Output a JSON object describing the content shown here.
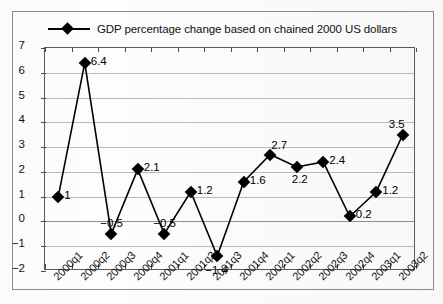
{
  "chart_data": {
    "type": "line",
    "title": "",
    "legend": [
      "GDP percentage change based on chained 2000 US dollars"
    ],
    "legend_position": "top",
    "categories": [
      "2000q1",
      "2000q2",
      "2000q3",
      "2000q4",
      "2001q1",
      "2001q2",
      "2001q3",
      "2001q4",
      "2002q1",
      "2002q2",
      "2002q3",
      "2002q4",
      "2003q1",
      "2003q2"
    ],
    "values": [
      1,
      6.4,
      -0.5,
      2.1,
      -0.5,
      1.2,
      -1.4,
      1.6,
      2.7,
      2.2,
      2.4,
      0.2,
      1.2,
      3.5
    ],
    "data_labels": [
      "1",
      "6.4",
      "-0.5",
      "2.1",
      "-0.5",
      "1.2",
      "-1.4",
      "1.6",
      "2.7",
      "2.2",
      "2.4",
      "0.2",
      "1.2",
      "3.5"
    ],
    "xlabel": "",
    "ylabel": "",
    "ylim": [
      -2,
      7
    ],
    "ytick_labels": [
      "7",
      "6",
      "5",
      "4",
      "3",
      "2",
      "1",
      "0",
      "-1",
      "-2"
    ],
    "yticks": [
      7,
      6,
      5,
      4,
      3,
      2,
      1,
      0,
      -1,
      -2
    ],
    "grid": true,
    "marker": "diamond",
    "series_color": "#000000",
    "grid_color": "#b9b9b9"
  },
  "legend": {
    "label": "GDP percentage change based on chained 2000 US dollars"
  }
}
